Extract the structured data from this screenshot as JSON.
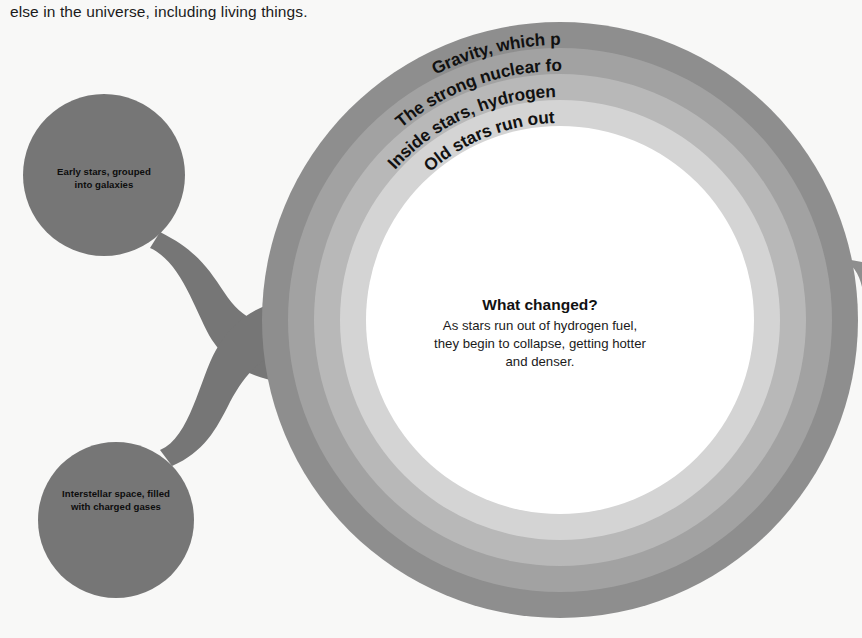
{
  "page": {
    "background_color": "#f8f8f7",
    "intro_text": "else in the universe, including living things."
  },
  "diagram": {
    "type": "concentric-rings-with-lobes",
    "ring_labels": [
      "Gravity, which pulls matter together",
      "The strong nuclear force, holding atoms together",
      "Inside stars, hydrogen nuclei fuse to form helium nuclei",
      "Old stars run out of hydrogen and helium"
    ],
    "ring_colors": [
      "#8e8e8e",
      "#a2a2a2",
      "#b8b8b8",
      "#d4d4d4",
      "#ffffff"
    ],
    "lobe_color": "#767676",
    "lobes": [
      {
        "label_line1": "Early stars, grouped",
        "label_line2": "into galaxies"
      },
      {
        "label_line1": "Interstellar space, filled",
        "label_line2": "with charged gases"
      }
    ],
    "center": {
      "title": "What changed?",
      "body_line1": "As stars run out of hydrogen fuel,",
      "body_line2": "they begin to collapse, getting hotter",
      "body_line3": "and denser."
    }
  }
}
